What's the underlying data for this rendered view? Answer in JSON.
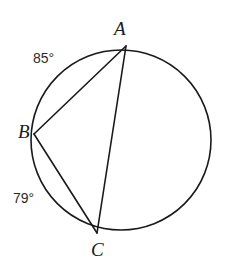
{
  "figure": {
    "type": "circle-with-inscribed-triangle",
    "background_color": "#ffffff",
    "stroke_color": "#1a1a1a",
    "text_color": "#1a1a1a"
  },
  "circle": {
    "center_x": 121,
    "center_y": 140,
    "radius": 90,
    "stroke_width": 1.6
  },
  "points": {
    "A": {
      "label": "A",
      "x": 126,
      "y": 46
    },
    "B": {
      "label": "B",
      "x": 34,
      "y": 134
    },
    "C": {
      "label": "C",
      "x": 97,
      "y": 233
    }
  },
  "chords": [
    {
      "name": "chord-AB",
      "from": "A",
      "to": "B"
    },
    {
      "name": "chord-AC",
      "from": "A",
      "to": "C"
    },
    {
      "name": "chord-BC",
      "from": "B",
      "to": "C"
    }
  ],
  "arc_measures": {
    "arc_AB": "85°",
    "arc_BC": "79°"
  }
}
